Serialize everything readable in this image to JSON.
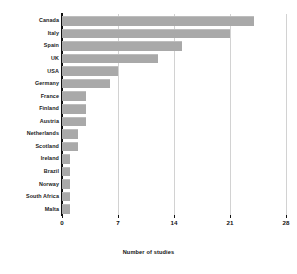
{
  "chart_data": {
    "type": "bar",
    "orientation": "horizontal",
    "title": "",
    "xlabel": "Number of studies",
    "ylabel": "",
    "categories": [
      "Canada",
      "Italy",
      "Spain",
      "UK",
      "USA",
      "Germany",
      "France",
      "Finland",
      "Austria",
      "Netherlands",
      "Scotland",
      "Ireland",
      "Brazil",
      "Norway",
      "South Africa",
      "Malta"
    ],
    "values": [
      24,
      21,
      15,
      12,
      7,
      6,
      3,
      3,
      3,
      2,
      2,
      1,
      1,
      1,
      1,
      1
    ],
    "xlim": [
      0,
      28
    ],
    "xticks": [
      0,
      7,
      14,
      21,
      28
    ],
    "xtick_labels": [
      "0",
      "7",
      "14",
      "21",
      "28"
    ],
    "grid": "vertical",
    "legend": null,
    "bar_color": "#a9a9a9",
    "axis_color": "#111111",
    "gridline_color": "#d2d2d2",
    "background": "#ffffff"
  }
}
